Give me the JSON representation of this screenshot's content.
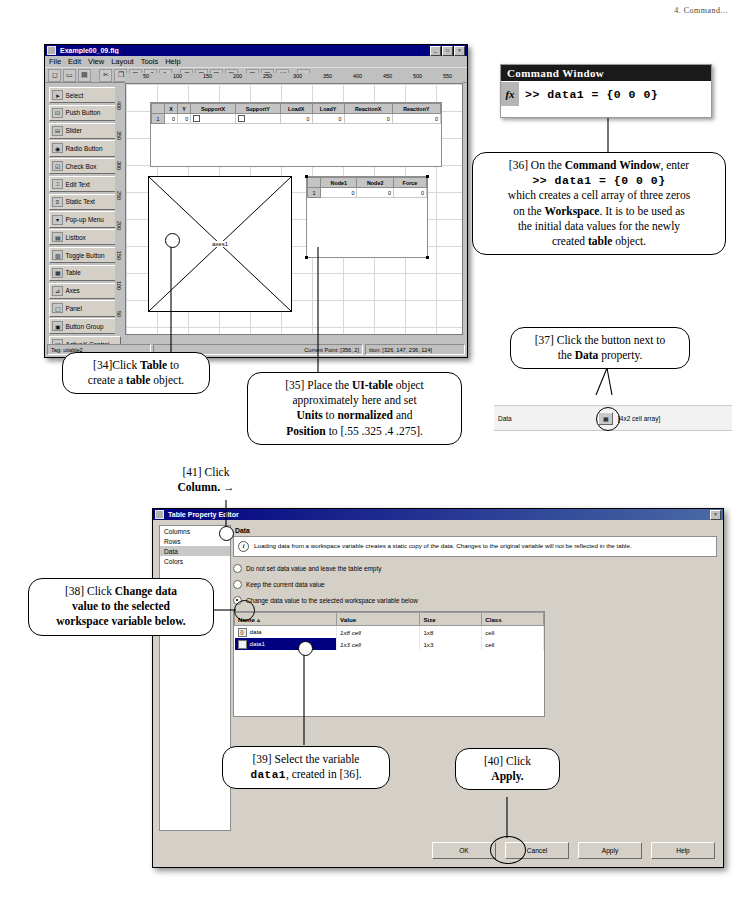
{
  "page_header": "4. Command...",
  "guide_window": {
    "title": "Example00_09.fig",
    "menus": [
      "File",
      "Edit",
      "View",
      "Layout",
      "Tools",
      "Help"
    ],
    "toolbar_icons": [
      "new-icon",
      "open-icon",
      "save-icon",
      "cut-icon",
      "copy-icon",
      "paste-icon",
      "undo-icon",
      "redo-icon",
      "align-icon",
      "grid-icon",
      "menu-editor-icon",
      "toolbar-editor-icon",
      "m-file-editor-icon",
      "property-inspector-icon",
      "object-browser-icon",
      "run-icon"
    ],
    "palette": [
      {
        "label": "Select",
        "icon": "arrow-icon"
      },
      {
        "label": "Push Button",
        "icon": "push-button-icon"
      },
      {
        "label": "Slider",
        "icon": "slider-icon"
      },
      {
        "label": "Radio Button",
        "icon": "radio-button-icon"
      },
      {
        "label": "Check Box",
        "icon": "check-box-icon"
      },
      {
        "label": "Edit Text",
        "icon": "edit-text-icon"
      },
      {
        "label": "Static Text",
        "icon": "static-text-icon"
      },
      {
        "label": "Pop-up Menu",
        "icon": "popup-menu-icon"
      },
      {
        "label": "Listbox",
        "icon": "listbox-icon"
      },
      {
        "label": "Toggle Button",
        "icon": "toggle-button-icon"
      },
      {
        "label": "Table",
        "icon": "table-icon"
      },
      {
        "label": "Axes",
        "icon": "axes-icon"
      },
      {
        "label": "Panel",
        "icon": "panel-icon"
      },
      {
        "label": "Button Group",
        "icon": "button-group-icon"
      },
      {
        "label": "ActiveX Control",
        "icon": "activex-icon"
      }
    ],
    "ruler_ticks": [
      "50",
      "100",
      "150",
      "200",
      "250",
      "300",
      "350",
      "400",
      "450",
      "500",
      "550"
    ],
    "vruler_ticks": [
      "400",
      "350",
      "300",
      "250",
      "200",
      "150",
      "100",
      "50",
      "0"
    ],
    "table1": {
      "columns": [
        "X",
        "Y",
        "SupportX",
        "SupportY",
        "LoadX",
        "LoadY",
        "ReactionX",
        "ReactionY"
      ],
      "row_header": "1",
      "cells": [
        "0",
        "0",
        "checkbox",
        "checkbox",
        "0",
        "0",
        "0",
        "0"
      ]
    },
    "table2": {
      "columns": [
        "Node1",
        "Node2",
        "Force"
      ],
      "row_header": "1",
      "cells": [
        "0",
        "0",
        "0"
      ]
    },
    "axes_label": "axes1",
    "status": {
      "tag": "Tag: uitable2",
      "current_point": "Current Point:  [356, 2]",
      "position": "ition: [326, 147, 236, 124]"
    }
  },
  "command_window": {
    "title": "Command Window",
    "fx": "fx",
    "line": ">> data1 = {0 0 0}"
  },
  "data_property_row": {
    "label": "Data",
    "button_icon": "table-browse-icon",
    "value": "[4x2 cell array]"
  },
  "callouts": {
    "c34": {
      "num": "[34]",
      "line1_pre": "Click ",
      "bold1": "Table",
      "line1_post": " to",
      "line2_pre": "create a ",
      "bold2": "table",
      "line2_post": " object."
    },
    "c35": {
      "num": "[35]",
      "t1a": "Place the ",
      "b1": "UI-table",
      "t1b": " object",
      "t2": "approximately here and set",
      "t3a": "",
      "b2": "Units",
      "t3b": " to ",
      "b3": "normalized",
      "t3c": " and",
      "t4a": "",
      "b4": "Position",
      "t4b": " to [.55 .325 .4 .275]."
    },
    "c36": {
      "num": "[36]",
      "t1a": "On the ",
      "b1": "Command Window",
      "t1b": ", enter",
      "code": ">> data1 = {0 0 0}",
      "t2": "which creates a cell array of three zeros",
      "t3a": "on the ",
      "b2": "Workspace",
      "t3b": ".  It is to be used as",
      "t4": "the initial data values for the newly",
      "t5a": "created ",
      "b3": "table",
      "t5b": " object."
    },
    "c37": {
      "num": "[37]",
      "t1": "Click the button next to",
      "t2a": "the ",
      "b1": "Data",
      "t2b": " property."
    },
    "c38": {
      "num": "[38]",
      "t1a": "Click ",
      "b1": "Change data",
      "t2": "value to the selected",
      "t3": "workspace variable below."
    },
    "c39": {
      "num": "[39]",
      "t1": "Select the variable",
      "code": "data1",
      "t2": ", created in [36]."
    },
    "c40": {
      "num": "[40]",
      "t1": "Click",
      "b1": "Apply."
    },
    "c41": {
      "num": "[41]",
      "t1": "Click",
      "b1": "Column.",
      "arrow": "→"
    }
  },
  "table_property_editor": {
    "title": "Table Property Editor",
    "sidebar": [
      "Columns",
      "Rows",
      "Data",
      "Colors"
    ],
    "selected_sidebar": "Data",
    "section_label": "Data",
    "info_icon": "info-icon",
    "info_text": "Loading data from a workspace variable creates a static copy of the data. Changes to the original variable will not be reflected in the table.",
    "radios": [
      {
        "label": "Do not set data value and leave the table empty",
        "selected": false
      },
      {
        "label": "Keep the current data value",
        "selected": false
      },
      {
        "label": "Change data value to the selected workspace variable below",
        "selected": true
      }
    ],
    "var_table": {
      "columns": [
        "Name  ▵",
        "Value",
        "Size",
        "Class"
      ],
      "rows": [
        {
          "name": "data",
          "value": "1x8 cell",
          "size": "1x8",
          "class": "cell",
          "selected": false
        },
        {
          "name": "data1",
          "value": "1x3 cell",
          "size": "1x3",
          "class": "cell",
          "selected": true
        }
      ]
    },
    "buttons": [
      "OK",
      "Cancel",
      "Apply",
      "Help"
    ]
  },
  "colors": {
    "titlebar": "#000080",
    "dialog_face": "#d4d0c8",
    "selection": "#000080",
    "page_bg": "#ffffff"
  }
}
